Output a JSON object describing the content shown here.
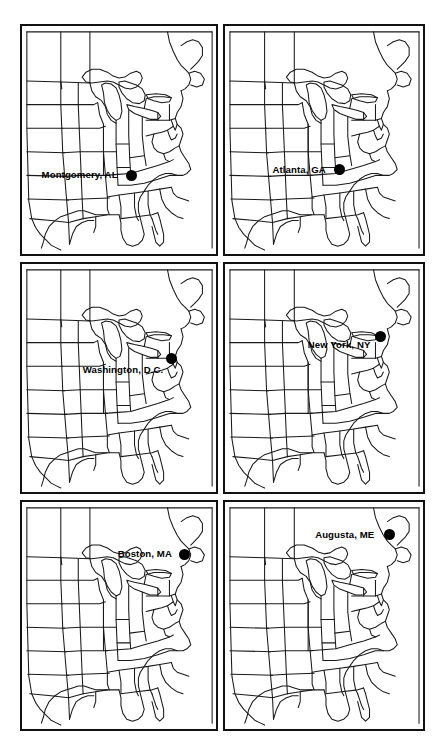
{
  "figure": {
    "background_color": "#ffffff",
    "frame_color": "#111111",
    "dot_color": "#000000",
    "outline_color": "#1a1a1a",
    "rows": 3,
    "columns": 2,
    "panel_count": 6
  },
  "panels": [
    {
      "index": 1,
      "label": "Montgomery, AL",
      "city": "Montgomery",
      "state": "AL",
      "dot_x_pct": 56.5,
      "dot_y_pct": 65.5,
      "label_offset_x": -8,
      "label_offset_y": 0
    },
    {
      "index": 2,
      "label": "Atlanta, GA",
      "city": "Atlanta",
      "state": "GA",
      "dot_x_pct": 58.0,
      "dot_y_pct": 63.0,
      "label_offset_x": -8,
      "label_offset_y": 0
    },
    {
      "index": 3,
      "label": "Washington, D.C.",
      "city": "Washington",
      "state": "D.C.",
      "dot_x_pct": 77.0,
      "dot_y_pct": 41.5,
      "label_offset_x": -2,
      "label_offset_y": 11
    },
    {
      "index": 4,
      "label": "New York, NY",
      "city": "New York",
      "state": "NY",
      "dot_x_pct": 78.5,
      "dot_y_pct": 32.0,
      "label_offset_x": -4,
      "label_offset_y": 8
    },
    {
      "index": 5,
      "label": "Boston, MA",
      "city": "Boston",
      "state": "MA",
      "dot_x_pct": 84.0,
      "dot_y_pct": 23.0,
      "label_offset_x": -7,
      "label_offset_y": 0
    },
    {
      "index": 6,
      "label": "Augusta, ME",
      "city": "Augusta",
      "state": "ME",
      "dot_x_pct": 83.0,
      "dot_y_pct": 14.5,
      "label_offset_x": -9,
      "label_offset_y": 0
    }
  ]
}
